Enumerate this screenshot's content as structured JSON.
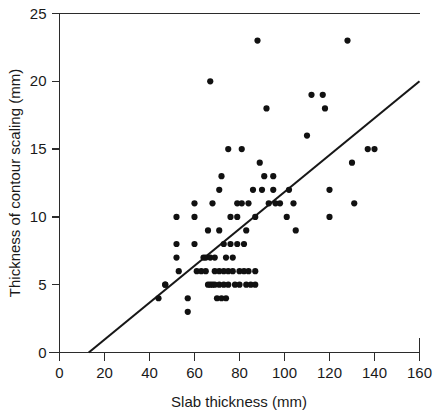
{
  "chart_data": {
    "type": "scatter",
    "title": "",
    "xlabel": "Slab thickness (mm)",
    "ylabel": "Thickness of contour scaling (mm)",
    "xlim": [
      0,
      160
    ],
    "ylim": [
      0,
      25
    ],
    "xticks": [
      0,
      20,
      40,
      60,
      80,
      100,
      120,
      140,
      160
    ],
    "yticks": [
      0,
      5,
      10,
      15,
      20,
      25
    ],
    "xtick_labels": [
      "0",
      "20",
      "40",
      "60",
      "80",
      "100",
      "120",
      "140",
      "160"
    ],
    "ytick_labels": [
      "0",
      "5",
      "10",
      "15",
      "20",
      "25"
    ],
    "grid": false,
    "legend": null,
    "marker": "filled-circle",
    "marker_color": "#111111",
    "marker_size_px": 3.1,
    "points": [
      [
        44,
        4
      ],
      [
        47,
        5
      ],
      [
        47,
        5
      ],
      [
        52,
        10
      ],
      [
        52,
        8
      ],
      [
        52,
        7
      ],
      [
        53,
        6
      ],
      [
        57,
        3
      ],
      [
        57,
        4
      ],
      [
        60,
        11
      ],
      [
        60,
        10
      ],
      [
        60,
        8
      ],
      [
        61,
        6
      ],
      [
        63,
        6
      ],
      [
        64,
        7
      ],
      [
        65,
        7
      ],
      [
        65,
        6
      ],
      [
        66,
        9
      ],
      [
        66,
        5
      ],
      [
        67,
        7
      ],
      [
        67,
        5
      ],
      [
        67,
        20
      ],
      [
        68,
        11
      ],
      [
        68,
        5
      ],
      [
        69,
        7
      ],
      [
        69,
        6
      ],
      [
        69,
        5
      ],
      [
        70,
        4
      ],
      [
        71,
        12
      ],
      [
        71,
        9
      ],
      [
        71,
        6
      ],
      [
        71,
        5
      ],
      [
        72,
        13
      ],
      [
        72,
        4
      ],
      [
        73,
        8
      ],
      [
        73,
        6
      ],
      [
        73,
        5
      ],
      [
        74,
        7
      ],
      [
        74,
        4
      ],
      [
        75,
        15
      ],
      [
        75,
        6
      ],
      [
        75,
        5
      ],
      [
        76,
        10
      ],
      [
        76,
        8
      ],
      [
        77,
        7
      ],
      [
        77,
        6
      ],
      [
        78,
        5
      ],
      [
        79,
        11
      ],
      [
        79,
        10
      ],
      [
        79,
        8
      ],
      [
        80,
        6
      ],
      [
        80,
        5
      ],
      [
        81,
        15
      ],
      [
        81,
        11
      ],
      [
        82,
        8
      ],
      [
        82,
        6
      ],
      [
        83,
        9
      ],
      [
        83,
        5
      ],
      [
        84,
        11
      ],
      [
        84,
        6
      ],
      [
        85,
        5
      ],
      [
        86,
        12
      ],
      [
        87,
        10
      ],
      [
        87,
        6
      ],
      [
        87,
        5
      ],
      [
        88,
        23
      ],
      [
        89,
        14
      ],
      [
        90,
        12
      ],
      [
        91,
        13
      ],
      [
        92,
        18
      ],
      [
        93,
        11
      ],
      [
        95,
        12
      ],
      [
        95,
        13
      ],
      [
        96,
        11
      ],
      [
        98,
        11
      ],
      [
        101,
        10
      ],
      [
        102,
        12
      ],
      [
        104,
        11
      ],
      [
        105,
        9
      ],
      [
        110,
        16
      ],
      [
        112,
        19
      ],
      [
        117,
        19
      ],
      [
        118,
        18
      ],
      [
        120,
        12
      ],
      [
        120,
        10
      ],
      [
        128,
        23
      ],
      [
        130,
        14
      ],
      [
        131,
        11
      ],
      [
        137,
        15
      ],
      [
        140,
        15
      ]
    ],
    "fit_line": {
      "type": "linear",
      "x_intercept": 13,
      "x_start": 13,
      "y_start": 0,
      "x_end": 160,
      "y_end": 20,
      "color": "#171717"
    }
  },
  "axes": {
    "x_axis_name": "slab-thickness-axis",
    "y_axis_name": "contour-scaling-axis"
  }
}
